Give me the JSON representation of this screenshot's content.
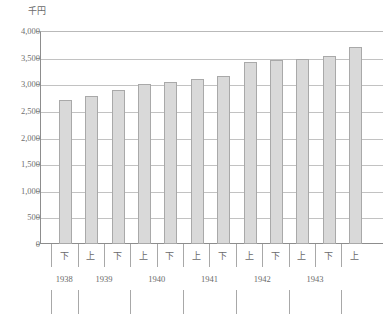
{
  "chart_data": {
    "type": "bar",
    "title": "",
    "subtitle": "",
    "unit_label": "千円",
    "xlabel": "",
    "ylabel": "",
    "ylim": [
      0,
      4000
    ],
    "ytick_values": [
      0,
      500,
      1000,
      1500,
      2000,
      2500,
      3000,
      3500,
      4000
    ],
    "ytick_labels": [
      "0",
      "500",
      "1,000",
      "1,500",
      "2,000",
      "2,500",
      "3,000",
      "3,500",
      "4,000"
    ],
    "grid": true,
    "legend": "none",
    "categories": [
      "1938 下",
      "1939 上",
      "1939 下",
      "1940 上",
      "1940 下",
      "1941 上",
      "1941 下",
      "1942 上",
      "1942 下",
      "1943 上",
      "1943 下",
      "1944 上"
    ],
    "half_labels": [
      "下",
      "上",
      "下",
      "上",
      "下",
      "上",
      "下",
      "上",
      "下",
      "上",
      "下",
      "上"
    ],
    "values": [
      2700,
      2780,
      2890,
      3000,
      3040,
      3100,
      3150,
      3420,
      3450,
      3470,
      3530,
      3700
    ],
    "bar_color": "#d9d9d9",
    "bar_border_color": "#a9a9a9",
    "grid_color": "#c2c2c2",
    "axis_color": "#8d8d8d",
    "year_groups": [
      {
        "year": "1938",
        "halves": 1
      },
      {
        "year": "1939",
        "halves": 2
      },
      {
        "year": "1940",
        "halves": 2
      },
      {
        "year": "1941",
        "halves": 2
      },
      {
        "year": "1942",
        "halves": 2
      },
      {
        "year": "1943",
        "halves": 2
      },
      {
        "year": "",
        "halves": 1
      }
    ]
  }
}
